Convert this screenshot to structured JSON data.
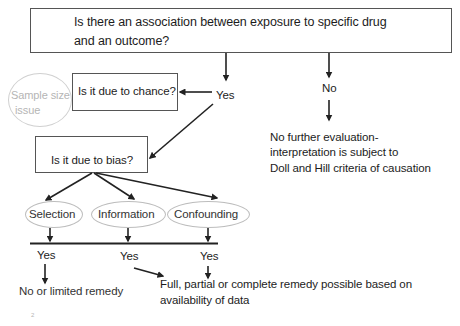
{
  "diagram": {
    "title_question": {
      "line1": "Is there an association  between exposure to specific drug",
      "line2": "and an outcome?"
    },
    "chance_question": "Is it due to chance?",
    "sample_size_note": {
      "line1": "Sample size",
      "line2": "issue"
    },
    "yes_label_top": "Yes",
    "no_label": "No",
    "no_outcome": {
      "line1": "No further evaluation-",
      "line2": "interpretation is subject to",
      "line3": "Doll and Hill criteria of causation"
    },
    "bias_question": "Is it due to bias?",
    "bias_types": [
      {
        "label": "Selection"
      },
      {
        "label": "Information"
      },
      {
        "label": "Confounding"
      }
    ],
    "bias_yes_labels": [
      "Yes",
      "Yes",
      "Yes"
    ],
    "selection_outcome": "No or  limited remedy",
    "remedy_outcome": {
      "line1": "Full, partial or complete remedy possible based  on",
      "line2": "availability of data"
    },
    "footer_mark": "2",
    "colors": {
      "box_border": "#555555",
      "arrow": "#222222",
      "oval_border": "#bdbdbd",
      "faint_text": "#b5b5b5"
    }
  }
}
